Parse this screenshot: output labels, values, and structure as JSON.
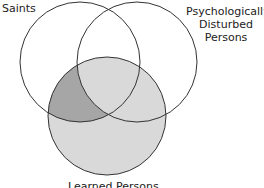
{
  "diagram": {
    "type": "venn",
    "sets": [
      {
        "name": "saints",
        "label": "Saints"
      },
      {
        "name": "psych",
        "label_lines": [
          "Psychologically",
          "Disturbed",
          "Persons"
        ]
      },
      {
        "name": "learned",
        "label": "Learned Persons"
      }
    ],
    "shading": {
      "learned_only": "light gray",
      "saints_and_learned_not_psych": "dark gray"
    },
    "colors": {
      "stroke": "#333333",
      "light_fill": "#d9d9d9",
      "dark_fill": "#a6a6a6"
    }
  }
}
